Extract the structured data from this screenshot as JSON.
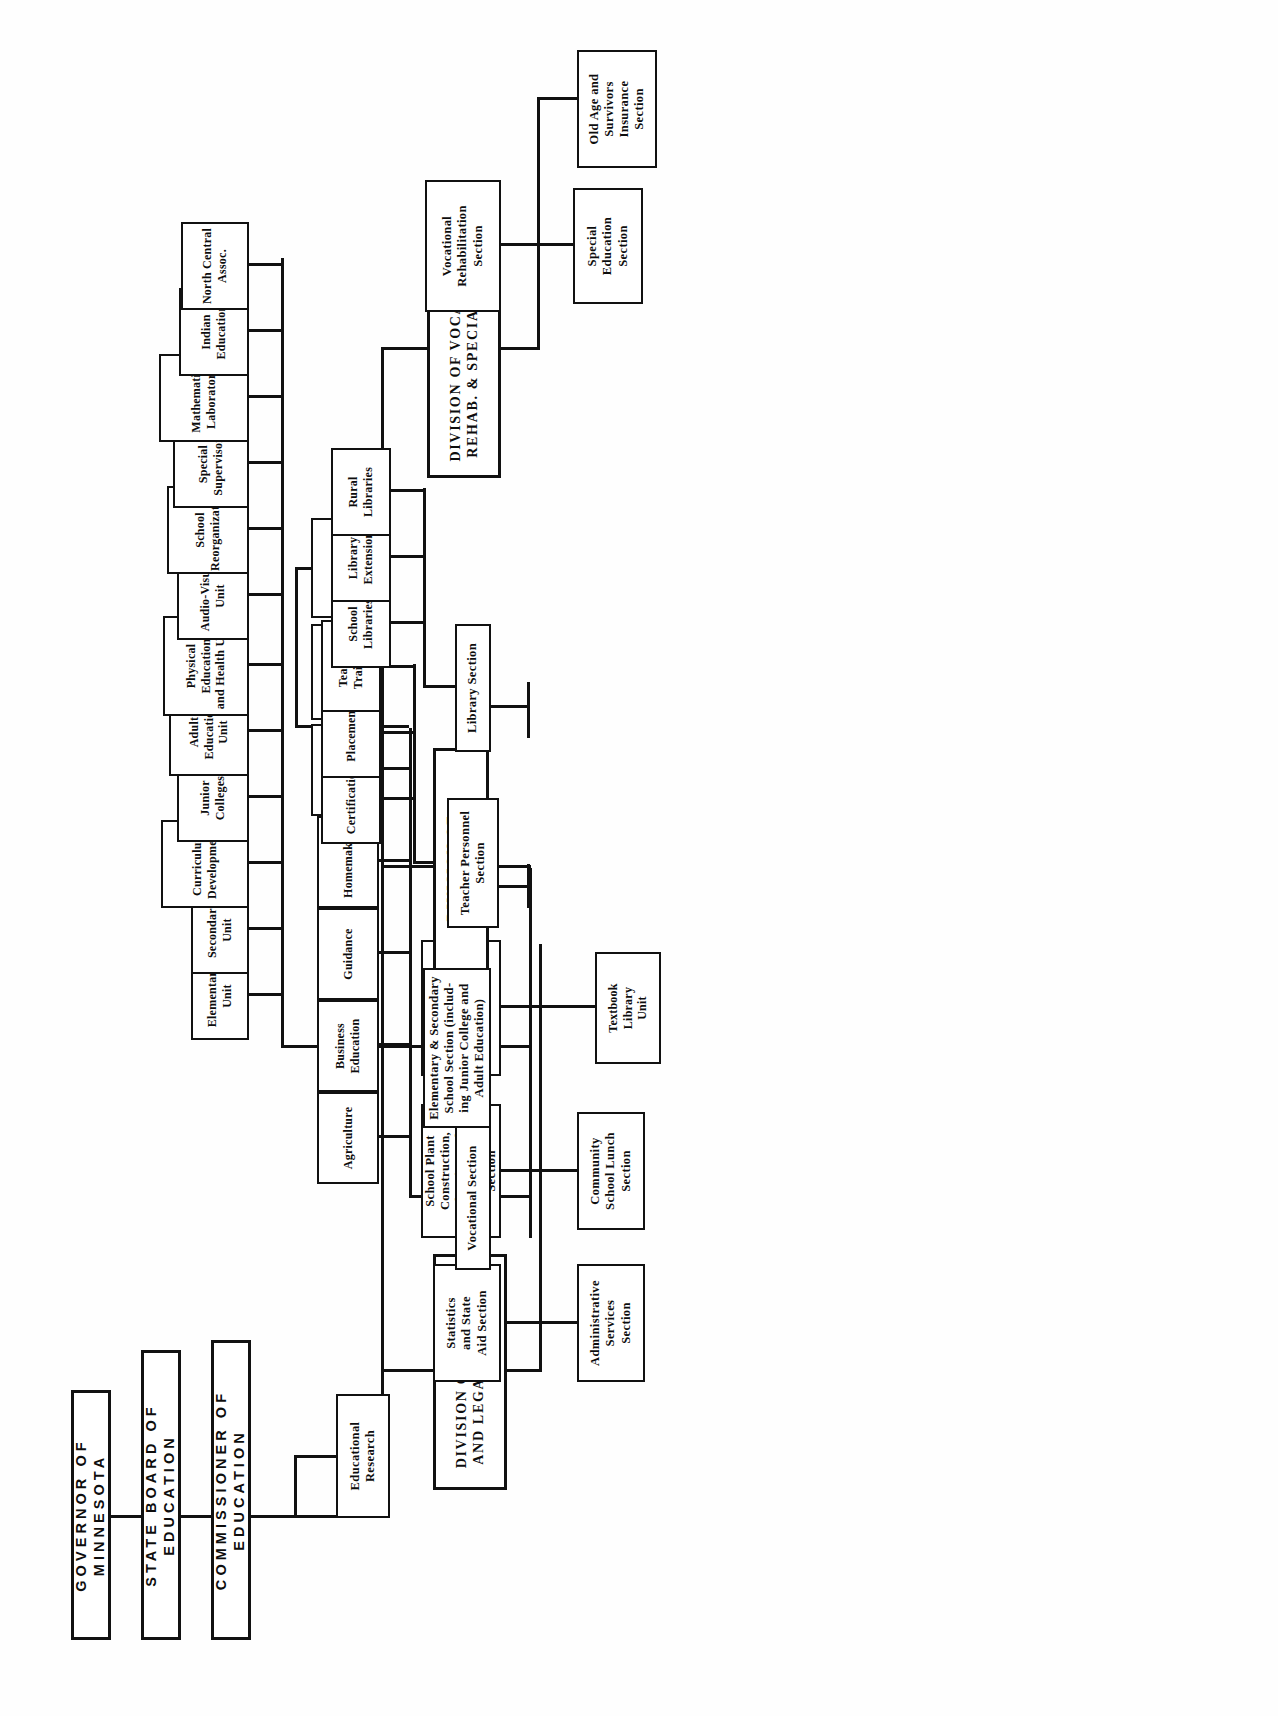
{
  "chart": {
    "orientation": "rotated-90",
    "top_level": [
      {
        "id": "governor",
        "label": "GOVERNOR OF MINNESOTA"
      },
      {
        "id": "state_board",
        "label": "STATE BOARD OF EDUCATION"
      },
      {
        "id": "commissioner",
        "label": "COMMISSIONER OF EDUCATION"
      }
    ],
    "staff": [
      {
        "id": "educational_research",
        "label": "Educational\nResearch"
      }
    ],
    "divisions": [
      {
        "id": "div_business",
        "label": "DIVISION OF BUSINESS\nAND LEGAL SERVICES",
        "sections": [
          {
            "id": "statistics_state_aid",
            "label": "Statistics\nand State\nAid Section"
          },
          {
            "id": "administrative_services",
            "label": "Administrative\nServices\nSection"
          },
          {
            "id": "school_plant",
            "label": "School Plant\nConstruction,\nPlanning and\nDevelopment\nSection"
          },
          {
            "id": "community_school_lunch",
            "label": "Community\nSchool Lunch\nSection"
          },
          {
            "id": "pupil_transportation",
            "label": "Pupil\nTransportation\nSection"
          }
        ],
        "units": [
          {
            "id": "textbook_library",
            "label": "Textbook\nLibrary\nUnit",
            "parent": "pupil_transportation"
          }
        ]
      },
      {
        "id": "div_instruction",
        "label": "DIVISION OF INSTRUCTION",
        "sections": [
          {
            "id": "vocational_section",
            "label": "Vocational Section"
          },
          {
            "id": "elem_secondary_section",
            "label": "Elementary & Secondary\nSchool Section (includ-\ning Junior College and\nAdult Education)"
          },
          {
            "id": "teacher_personnel_section",
            "label": "Teacher Personnel\nSection"
          },
          {
            "id": "library_section",
            "label": "Library Section"
          }
        ],
        "vocational_units": [
          {
            "label": "Agriculture"
          },
          {
            "label": "Business Education"
          },
          {
            "label": "Guidance"
          },
          {
            "label": "Homemaking"
          },
          {
            "label": "Trade and\nIndustrial"
          },
          {
            "label": "Private Trade\nSchools"
          },
          {
            "label": "Area Vocational\nSchools"
          }
        ],
        "elem_secondary_units": [
          {
            "label": "Elementary Unit"
          },
          {
            "label": "Secondary Unit"
          },
          {
            "label": "Curriculum Development"
          },
          {
            "label": "Junior Colleges"
          },
          {
            "label": "Adult Education Unit"
          },
          {
            "label": "Physical Education\nand Health Unit"
          },
          {
            "label": "Audio-Visual Unit"
          },
          {
            "label": "School Reorganization"
          },
          {
            "label": "Special Supervisors"
          },
          {
            "label": "Mathematics Laboratory"
          },
          {
            "label": "Indian Education"
          },
          {
            "label": "North Central Assoc."
          }
        ],
        "teacher_personnel_units": [
          {
            "label": "Certification"
          },
          {
            "label": "Placement"
          },
          {
            "label": "Teacher Training"
          }
        ],
        "library_units": [
          {
            "label": "School Libraries"
          },
          {
            "label": "Library Extension"
          },
          {
            "label": "Rural Libraries"
          }
        ]
      },
      {
        "id": "div_vocational_rehab",
        "label": "DIVISION OF VOCATIONAL\nREHAB. & SPECIAL EDUC.",
        "sections": [
          {
            "id": "vocational_rehabilitation",
            "label": "Vocational\nRehabilitation\nSection"
          },
          {
            "id": "special_education",
            "label": "Special\nEducation\nSection"
          },
          {
            "id": "old_age_survivors",
            "label": "Old Age and\nSurvivors\nInsurance\nSection"
          }
        ]
      }
    ],
    "colors": {
      "ink": "#111111",
      "paper": "#ffffff"
    }
  }
}
